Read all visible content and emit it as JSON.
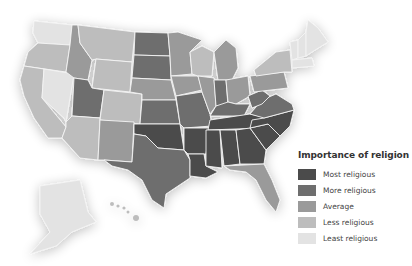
{
  "legend": {
    "title": "Importance of religion",
    "items": [
      {
        "label": "Most religious",
        "color": "#4b4b4b",
        "level": 5
      },
      {
        "label": "More religious",
        "color": "#6e6e6e",
        "level": 4
      },
      {
        "label": "Average",
        "color": "#9a9a9a",
        "level": 3
      },
      {
        "label": "Less religious",
        "color": "#bdbdbd",
        "level": 2
      },
      {
        "label": "Least religious",
        "color": "#e3e3e3",
        "level": 1
      }
    ]
  },
  "states": {
    "WA": 1,
    "OR": 2,
    "CA": 2,
    "NV": 1,
    "ID": 3,
    "MT": 2,
    "WY": 2,
    "UT": 4,
    "AZ": 2,
    "CO": 2,
    "NM": 3,
    "ND": 4,
    "SD": 4,
    "NE": 3,
    "KS": 4,
    "OK": 5,
    "TX": 4,
    "MN": 3,
    "IA": 3,
    "MO": 4,
    "AR": 5,
    "LA": 5,
    "WI": 2,
    "IL": 3,
    "MI": 3,
    "IN": 4,
    "OH": 3,
    "KY": 4,
    "TN": 5,
    "MS": 5,
    "AL": 5,
    "GA": 5,
    "FL": 3,
    "SC": 5,
    "NC": 5,
    "VA": 4,
    "WV": 4,
    "PA": 3,
    "NY": 2,
    "VT": 1,
    "NH": 1,
    "ME": 1,
    "MA": 1,
    "AK": 1,
    "HI": 2
  }
}
